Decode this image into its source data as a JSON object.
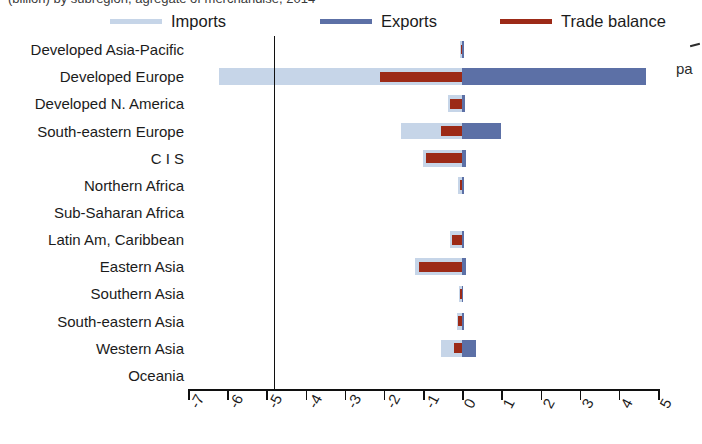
{
  "caption": {
    "top_clipped_text": "(billion) by subregion, agregate of merchandise, 2014",
    "right_clipped_text": "pa"
  },
  "legend": {
    "position": "top",
    "items": [
      {
        "label": "Imports",
        "color": "#c6d5e8",
        "icon": "line-swatch"
      },
      {
        "label": "Exports",
        "color": "#5c70a6",
        "icon": "line-swatch"
      },
      {
        "label": "Trade balance",
        "color": "#9c2a17",
        "icon": "line-swatch"
      }
    ]
  },
  "chart_data": {
    "type": "bar",
    "orientation": "horizontal",
    "title": "",
    "subtitle": "",
    "xlabel": "",
    "ylabel": "",
    "xlim": [
      -7,
      5
    ],
    "grid": false,
    "legend_position": "top",
    "xticks": [
      -7,
      -6,
      -5,
      -4,
      -3,
      -2,
      -1,
      0,
      1,
      2,
      3,
      4,
      5
    ],
    "xticklabels": [
      "-7",
      "-6",
      "-5",
      "-4",
      "-3",
      "-2",
      "-1",
      "0",
      "1",
      "2",
      "3",
      "4",
      "5"
    ],
    "categories": [
      "Developed Asia-Pacific",
      "Developed Europe",
      "Developed N. America",
      "South-eastern Europe",
      "C I S",
      "Northern Africa",
      "Sub-Saharan Africa",
      "Latin Am, Caribbean",
      "Eastern Asia",
      "Southern Asia",
      "South-eastern Asia",
      "Western Asia",
      "Oceania"
    ],
    "series": [
      {
        "name": "Imports",
        "color": "#c6d5e8",
        "values": [
          -0.05,
          -6.2,
          -0.35,
          -1.55,
          -1.0,
          -0.1,
          0.0,
          -0.3,
          -1.2,
          -0.08,
          -0.12,
          -0.55,
          0.0
        ]
      },
      {
        "name": "Exports",
        "color": "#5c70a6",
        "values": [
          0.05,
          4.7,
          0.06,
          1.0,
          0.1,
          0.04,
          0.0,
          0.05,
          0.1,
          0.03,
          0.05,
          0.35,
          0.0
        ]
      },
      {
        "name": "Trade balance",
        "color": "#9c2a17",
        "values": [
          -0.04,
          -2.1,
          -0.3,
          -0.55,
          -0.92,
          -0.06,
          0.0,
          -0.25,
          -1.1,
          -0.06,
          -0.1,
          -0.2,
          0.0
        ]
      }
    ]
  }
}
